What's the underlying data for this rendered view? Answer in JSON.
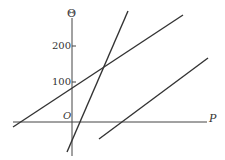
{
  "axes": {
    "y_label": "Θ",
    "x_label": "P",
    "origin_label": "O",
    "y_ticks": [
      {
        "label": "200",
        "y": 46
      },
      {
        "label": "100",
        "y": 82
      }
    ]
  },
  "lines": [
    {
      "name": "line-1",
      "x1": 13,
      "y1": 127,
      "x2": 183,
      "y2": 15
    },
    {
      "name": "line-2",
      "x1": 67,
      "y1": 152,
      "x2": 128,
      "y2": 11
    },
    {
      "name": "line-3",
      "x1": 99,
      "y1": 139,
      "x2": 208,
      "y2": 58
    }
  ],
  "colors": {
    "ink": "#333333"
  }
}
